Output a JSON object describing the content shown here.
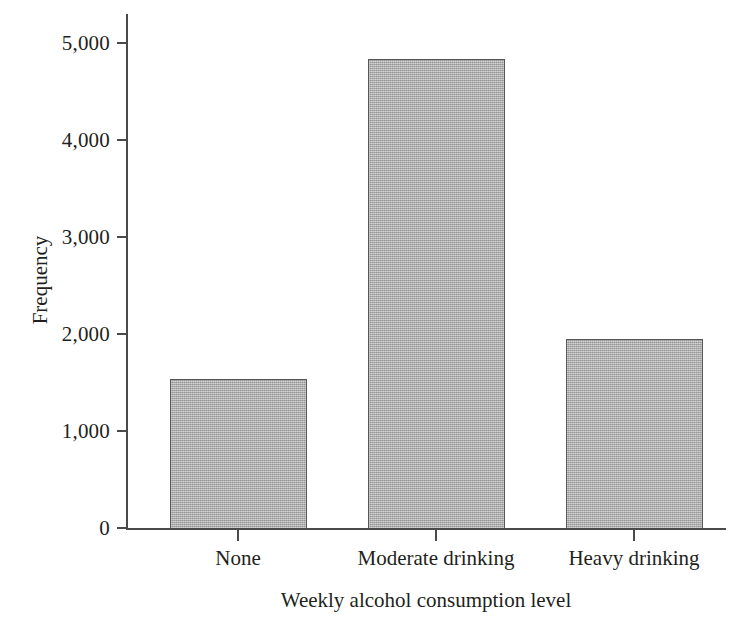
{
  "chart_data": {
    "type": "bar",
    "title": "",
    "categories": [
      "None",
      "Moderate drinking",
      "Heavy drinking"
    ],
    "values": [
      1535,
      4835,
      1950
    ],
    "series": [
      {
        "name": "Frequency",
        "values": [
          1535,
          4835,
          1950
        ]
      }
    ],
    "xlabel": "Weekly alcohol consumption level",
    "ylabel": "Frequency",
    "ylim": [
      0,
      5300
    ],
    "xlim": [
      0,
      3
    ],
    "ytick_values": [
      0,
      1000,
      2000,
      3000,
      4000,
      5000
    ],
    "ytick_labels": [
      "0",
      "1,000",
      "2,000",
      "3,000",
      "4,000",
      "5,000"
    ],
    "xtick_labels": [
      "None",
      "Moderate drinking",
      "Heavy drinking"
    ],
    "grid": false,
    "legend": false,
    "legend_position": "none",
    "bar_fill_color": "#acacac",
    "bar_edge_color": "#575757",
    "axis_color": "#4a4a4a",
    "text_color": "#231f20",
    "background_color": "#ffffff"
  },
  "axes": {
    "y": {
      "title": "Frequency",
      "ticks": [
        {
          "label": "5,000",
          "value": 5000
        },
        {
          "label": "4,000",
          "value": 4000
        },
        {
          "label": "3,000",
          "value": 3000
        },
        {
          "label": "2,000",
          "value": 2000
        },
        {
          "label": "1,000",
          "value": 1000
        },
        {
          "label": "0",
          "value": 0
        }
      ]
    },
    "x": {
      "title": "Weekly alcohol consumption level",
      "ticks": [
        {
          "label": "None"
        },
        {
          "label": "Moderate drinking"
        },
        {
          "label": "Heavy drinking"
        }
      ]
    }
  }
}
